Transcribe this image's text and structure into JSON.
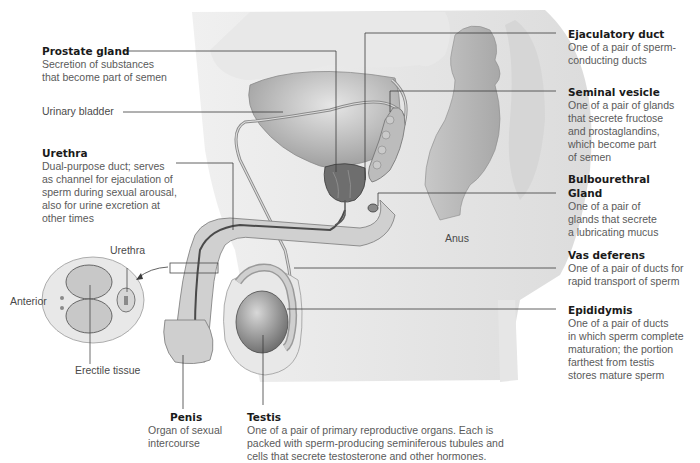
{
  "diagram": {
    "type": "anatomical-illustration",
    "colors": {
      "label_title": "#1a1a1a",
      "label_desc": "#5a5a5a",
      "leader_line": "#3a3a3a",
      "tissue_light": "#e4e4e4",
      "tissue_mid": "#bdbdbd",
      "tissue_dark": "#6e6e6e"
    }
  },
  "labels": {
    "prostate": {
      "title": "Prostate gland",
      "desc": "Secretion of substances\nthat become part of semen"
    },
    "bladder": {
      "title": "Urinary bladder"
    },
    "urethra": {
      "title": "Urethra",
      "desc": "Dual-purpose duct; serves\nas channel for ejaculation of\nsperm during sexual arousal,\nalso for urine excretion at\nother times"
    },
    "ejaculatory": {
      "title": "Ejaculatory duct",
      "desc": "One of a pair of sperm-\nconducting ducts"
    },
    "seminal": {
      "title": "Seminal vesicle",
      "desc": "One of a pair of glands\nthat secrete fructose\nand prostaglandins,\nwhich become part\nof semen"
    },
    "bulbourethral": {
      "title": "Bulbourethral\nGland",
      "desc": "One of a pair of\nglands that secrete\na lubricating mucus"
    },
    "vas": {
      "title": "Vas deferens",
      "desc": "One of a pair of ducts for\nrapid transport of sperm"
    },
    "epididymis": {
      "title": "Epididymis",
      "desc": "One of a pair of ducts\nin which sperm complete\nmaturation; the portion\nfarthest from testis\nstores mature sperm"
    },
    "penis": {
      "title": "Penis",
      "desc": "Organ of sexual\nintercourse"
    },
    "testis": {
      "title": "Testis",
      "desc": "One of a pair of primary reproductive organs. Each is\npacked with sperm-producing seminiferous tubules and\ncells that secrete testosterone and other hormones."
    },
    "anus": "Anus",
    "inset": {
      "urethra": "Urethra",
      "anterior": "Anterior",
      "erectile": "Erectile tissue"
    }
  }
}
